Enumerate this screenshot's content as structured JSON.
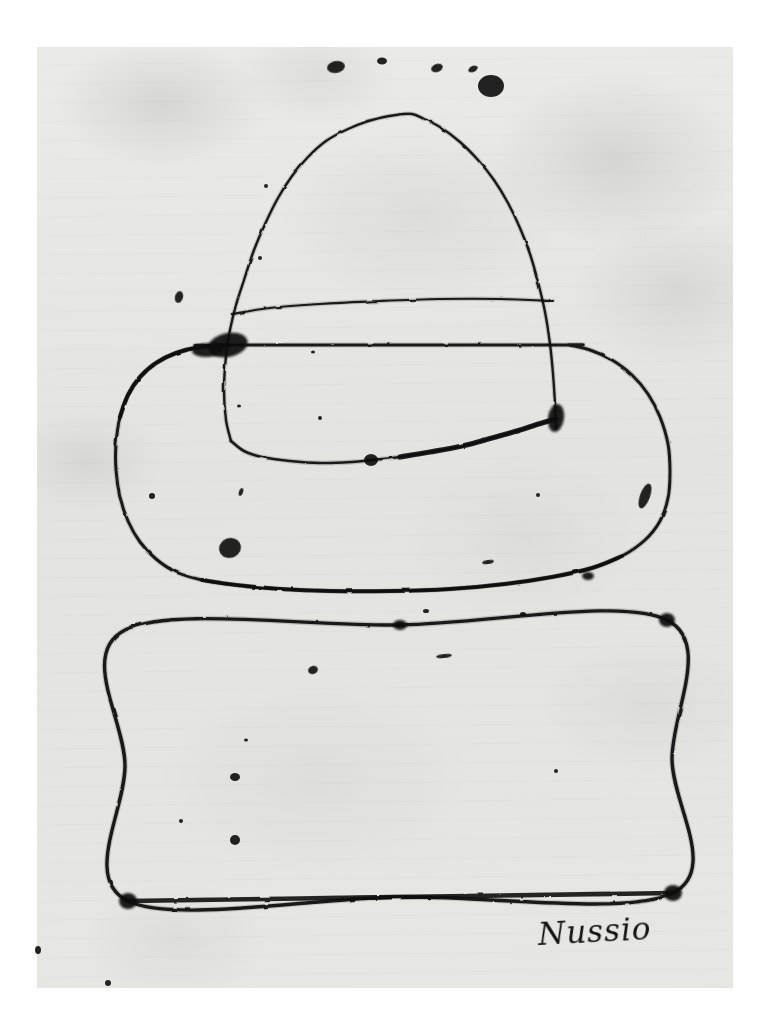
{
  "artwork": {
    "title": "Untitled — hat over rectangle",
    "medium": "ink on paper",
    "signature": "Nussio",
    "background_color": "#ffffff",
    "paper_color": "#f3f3f1",
    "ink_color": "#111111"
  },
  "paper": {
    "left": 37,
    "top": 47,
    "width": 696,
    "height": 941
  },
  "elements": {
    "crown_label": "hat crown",
    "band_label": "hat band line",
    "brim_label": "hat brim",
    "rectangle_label": "rectangle below hat",
    "spots_label": "ink spots"
  },
  "chart_data": {
    "type": "line",
    "xlabel": "",
    "ylabel": "",
    "xlim": [
      0,
      764
    ],
    "ylim": [
      0,
      1012
    ],
    "grid": false,
    "legend": "none",
    "series": [
      {
        "name": "crown",
        "closed": false,
        "points": [
          [
            231,
            441
          ],
          [
            226,
            420
          ],
          [
            224,
            390
          ],
          [
            226,
            356
          ],
          [
            230,
            330
          ],
          [
            236,
            305
          ],
          [
            244,
            280
          ],
          [
            254,
            250
          ],
          [
            266,
            222
          ],
          [
            278,
            198
          ],
          [
            292,
            176
          ],
          [
            308,
            157
          ],
          [
            326,
            141
          ],
          [
            348,
            129
          ],
          [
            372,
            120
          ],
          [
            396,
            115
          ],
          [
            412,
            114
          ],
          [
            424,
            119
          ],
          [
            440,
            127
          ],
          [
            460,
            142
          ],
          [
            478,
            160
          ],
          [
            494,
            180
          ],
          [
            508,
            203
          ],
          [
            520,
            228
          ],
          [
            530,
            254
          ],
          [
            538,
            282
          ],
          [
            545,
            312
          ],
          [
            550,
            344
          ],
          [
            553,
            374
          ],
          [
            555,
            404
          ],
          [
            556,
            428
          ]
        ]
      },
      {
        "name": "band",
        "closed": false,
        "points": [
          [
            232,
            314
          ],
          [
            270,
            308
          ],
          [
            320,
            304
          ],
          [
            380,
            301
          ],
          [
            440,
            299
          ],
          [
            500,
            299
          ],
          [
            553,
            301
          ]
        ]
      },
      {
        "name": "crown_bottom",
        "closed": false,
        "points": [
          [
            231,
            441
          ],
          [
            244,
            451
          ],
          [
            262,
            457
          ],
          [
            290,
            461
          ],
          [
            320,
            463
          ],
          [
            352,
            462
          ],
          [
            372,
            460
          ],
          [
            400,
            457
          ],
          [
            430,
            452
          ],
          [
            462,
            446
          ],
          [
            492,
            438
          ],
          [
            520,
            430
          ],
          [
            542,
            423
          ],
          [
            556,
            419
          ]
        ]
      },
      {
        "name": "brim",
        "closed": true,
        "points": [
          [
            228,
            345
          ],
          [
            200,
            347
          ],
          [
            176,
            353
          ],
          [
            156,
            363
          ],
          [
            140,
            377
          ],
          [
            128,
            395
          ],
          [
            120,
            417
          ],
          [
            116,
            444
          ],
          [
            116,
            470
          ],
          [
            120,
            497
          ],
          [
            128,
            521
          ],
          [
            140,
            542
          ],
          [
            156,
            559
          ],
          [
            176,
            572
          ],
          [
            202,
            580
          ],
          [
            236,
            585
          ],
          [
            280,
            589
          ],
          [
            330,
            591
          ],
          [
            390,
            591
          ],
          [
            450,
            589
          ],
          [
            505,
            584
          ],
          [
            552,
            577
          ],
          [
            592,
            568
          ],
          [
            622,
            556
          ],
          [
            645,
            540
          ],
          [
            660,
            521
          ],
          [
            668,
            498
          ],
          [
            670,
            472
          ],
          [
            668,
            444
          ],
          [
            660,
            417
          ],
          [
            648,
            394
          ],
          [
            632,
            375
          ],
          [
            612,
            360
          ],
          [
            590,
            350
          ],
          [
            568,
            345
          ],
          [
            556,
            345
          ]
        ]
      },
      {
        "name": "rectangle",
        "closed": true,
        "points": [
          [
            125,
            630
          ],
          [
            400,
            625
          ],
          [
            667,
            620
          ],
          [
            672,
            760
          ],
          [
            673,
            893
          ],
          [
            400,
            897
          ],
          [
            128,
            901
          ],
          [
            125,
            765
          ]
        ]
      }
    ],
    "spots": [
      {
        "x": 336,
        "y": 67,
        "rx": 9,
        "ry": 6,
        "rot": -10
      },
      {
        "x": 382,
        "y": 61,
        "rx": 5,
        "ry": 3.5,
        "rot": 0
      },
      {
        "x": 437,
        "y": 68,
        "rx": 6,
        "ry": 4,
        "rot": -20
      },
      {
        "x": 473,
        "y": 69,
        "rx": 5,
        "ry": 3,
        "rot": -25
      },
      {
        "x": 491,
        "y": 86,
        "rx": 13,
        "ry": 11,
        "rot": 0
      },
      {
        "x": 266,
        "y": 186,
        "rx": 2,
        "ry": 2,
        "rot": 0
      },
      {
        "x": 179,
        "y": 297,
        "rx": 4,
        "ry": 6,
        "rot": 15
      },
      {
        "x": 260,
        "y": 258,
        "rx": 2,
        "ry": 2,
        "rot": 0
      },
      {
        "x": 313,
        "y": 352,
        "rx": 2,
        "ry": 1.6,
        "rot": 0
      },
      {
        "x": 320,
        "y": 418,
        "rx": 2,
        "ry": 2,
        "rot": 0
      },
      {
        "x": 371,
        "y": 460,
        "rx": 7,
        "ry": 6,
        "rot": 0
      },
      {
        "x": 239,
        "y": 406,
        "rx": 2,
        "ry": 1.6,
        "rot": 0
      },
      {
        "x": 230,
        "y": 548,
        "rx": 11,
        "ry": 10,
        "rot": -20
      },
      {
        "x": 645,
        "y": 496,
        "rx": 5,
        "ry": 13,
        "rot": 20
      },
      {
        "x": 241,
        "y": 492,
        "rx": 2,
        "ry": 4,
        "rot": 20
      },
      {
        "x": 538,
        "y": 495,
        "rx": 2,
        "ry": 2,
        "rot": 0
      },
      {
        "x": 152,
        "y": 496,
        "rx": 3,
        "ry": 3,
        "rot": 0
      },
      {
        "x": 488,
        "y": 562,
        "rx": 6,
        "ry": 2,
        "rot": -8
      },
      {
        "x": 313,
        "y": 670,
        "rx": 5,
        "ry": 4,
        "rot": -20
      },
      {
        "x": 235,
        "y": 777,
        "rx": 5,
        "ry": 4,
        "rot": 0
      },
      {
        "x": 235,
        "y": 840,
        "rx": 5,
        "ry": 5,
        "rot": 0
      },
      {
        "x": 246,
        "y": 740,
        "rx": 2,
        "ry": 1.6,
        "rot": 0
      },
      {
        "x": 181,
        "y": 821,
        "rx": 2,
        "ry": 2,
        "rot": 0
      },
      {
        "x": 444,
        "y": 656,
        "rx": 8,
        "ry": 2,
        "rot": -6
      },
      {
        "x": 426,
        "y": 611,
        "rx": 3,
        "ry": 2,
        "rot": 0
      },
      {
        "x": 523,
        "y": 614,
        "rx": 3,
        "ry": 2,
        "rot": 0
      },
      {
        "x": 38,
        "y": 950,
        "rx": 3,
        "ry": 4,
        "rot": 0
      },
      {
        "x": 108,
        "y": 983,
        "rx": 3,
        "ry": 3,
        "rot": 0
      },
      {
        "x": 556,
        "y": 771,
        "rx": 2,
        "ry": 2,
        "rot": 0
      }
    ],
    "blots": [
      {
        "x": 228,
        "y": 345,
        "rx": 20,
        "ry": 12,
        "rot": -12
      },
      {
        "x": 208,
        "y": 350,
        "rx": 16,
        "ry": 7,
        "rot": -4
      },
      {
        "x": 556,
        "y": 418,
        "rx": 8,
        "ry": 14,
        "rot": 8
      },
      {
        "x": 128,
        "y": 901,
        "rx": 9,
        "ry": 8,
        "rot": 0
      },
      {
        "x": 673,
        "y": 893,
        "rx": 9,
        "ry": 8,
        "rot": 0
      },
      {
        "x": 667,
        "y": 620,
        "rx": 8,
        "ry": 7,
        "rot": 0
      },
      {
        "x": 400,
        "y": 625,
        "rx": 7,
        "ry": 5,
        "rot": 0
      },
      {
        "x": 588,
        "y": 576,
        "rx": 6,
        "ry": 4,
        "rot": 0
      }
    ]
  }
}
